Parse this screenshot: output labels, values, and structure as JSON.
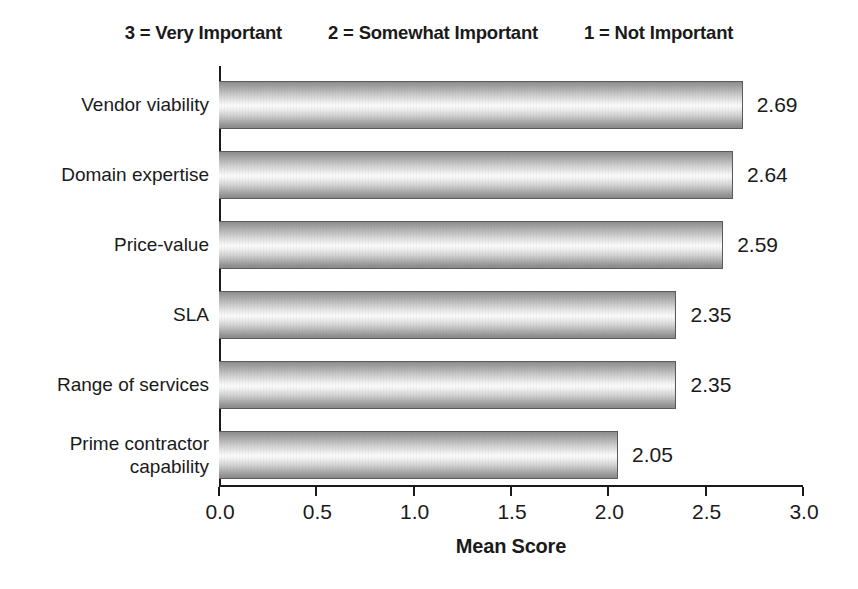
{
  "legend": {
    "entries": [
      "3 = Very Important",
      "2 = Somewhat Important",
      "1 = Not Important"
    ]
  },
  "chart_data": {
    "type": "bar",
    "orientation": "horizontal",
    "title": "",
    "xlabel": "Mean Score",
    "ylabel": "",
    "xlim": [
      0.0,
      3.0
    ],
    "xticks": [
      "0.0",
      "0.5",
      "1.0",
      "1.5",
      "2.0",
      "2.5",
      "3.0"
    ],
    "xtick_values": [
      0.0,
      0.5,
      1.0,
      1.5,
      2.0,
      2.5,
      3.0
    ],
    "grid": false,
    "legend_position": "top",
    "categories": [
      "Vendor viability",
      "Domain expertise",
      "Price-value",
      "SLA",
      "Range of services",
      "Prime contractor\ncapability"
    ],
    "values": [
      2.69,
      2.64,
      2.59,
      2.35,
      2.35,
      2.05
    ],
    "value_labels": [
      "2.69",
      "2.64",
      "2.59",
      "2.35",
      "2.35",
      "2.05"
    ],
    "bar_fill": "grey-cylinder-gradient",
    "bar_edge_color": "#5a5a5a",
    "axis_color": "#1a1a1a",
    "background_color": "#ffffff"
  }
}
